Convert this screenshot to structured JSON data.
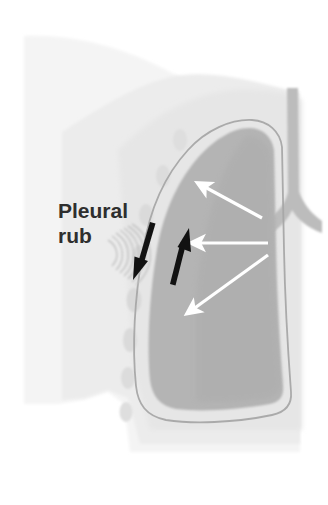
{
  "figure": {
    "type": "anatomical-diagram",
    "background_color": "#ffffff"
  },
  "labels": {
    "pleural_rub_line1": "Pleural",
    "pleural_rub_line2": "rub",
    "pleural_rub_full": "Pleural rub",
    "text_color": "#2e2e2e"
  },
  "colors": {
    "background": "#ffffff",
    "torso_fill": "#f2f2f2",
    "torso_fill_inner": "#ededed",
    "chest_wall_fill": "#eaeaea",
    "lung_fill": "#b3b3b3",
    "lung_fill_shadow": "#a9a9a9",
    "pleural_line": "#a8a8a8",
    "airway_fill": "#b9b9b9",
    "rib_dot": "#dcdcdc",
    "black_arrow": "#111111",
    "white_arrow": "#ffffff",
    "rub_arc": "#c9c9c9"
  },
  "anatomy": {
    "parts": [
      {
        "name": "torso-silhouette",
        "description": "outer body wall of chest, shoulder slope descending left-to-right",
        "fill": "#f2f2f2"
      },
      {
        "name": "chest-wall",
        "description": "soft tissue band between skin and pleura",
        "fill": "#eaeaea"
      },
      {
        "name": "lung",
        "description": "lung parenchyma, rounded apex upper-right, broad base lower-left",
        "fill": "#b3b3b3"
      },
      {
        "name": "pleura",
        "description": "thin outline surrounding the lung representing visceral and parietal pleura",
        "stroke": "#a8a8a8"
      },
      {
        "name": "trachea",
        "description": "vertical airway at upper right",
        "fill": "#b9b9b9"
      },
      {
        "name": "bronchi",
        "description": "bifurcation of trachea into main bronchi",
        "fill": "#b9b9b9"
      },
      {
        "name": "ribs",
        "description": "column of faint oval rib cross-sections along chest wall",
        "fill": "#dcdcdc"
      }
    ],
    "rib_count": 8
  },
  "annotations": {
    "rub_arcs": {
      "name": "pleural-rub-sound-arcs",
      "description": "concentric arcs opening rightward indicating the friction sound of a pleural rub",
      "arc_count": 7,
      "color": "#c9c9c9"
    },
    "black_arrows": [
      {
        "name": "pleural-motion-arrow-down",
        "direction": "down-left",
        "color": "#111111",
        "description": "parietal pleura sliding downward"
      },
      {
        "name": "pleural-motion-arrow-up",
        "direction": "up-right",
        "color": "#111111",
        "description": "visceral pleura sliding upward"
      }
    ],
    "white_arrows": [
      {
        "name": "airflow-arrow-upper",
        "direction": "up-left",
        "color": "#ffffff",
        "description": "airflow from bronchus to upper lobe"
      },
      {
        "name": "airflow-arrow-middle",
        "direction": "left",
        "color": "#ffffff",
        "description": "airflow from bronchus to mid lung"
      },
      {
        "name": "airflow-arrow-lower",
        "direction": "down-left",
        "color": "#ffffff",
        "description": "airflow from bronchus to lower lobe"
      }
    ]
  }
}
